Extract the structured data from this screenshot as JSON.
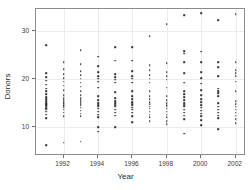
{
  "chart_data": {
    "type": "scatter",
    "title": "",
    "xlabel": "Year",
    "ylabel": "Donors",
    "xlim": [
      1990.4,
      2002.6
    ],
    "ylim": [
      4.0,
      34.5
    ],
    "xticks": [
      1992,
      1994,
      1996,
      1998,
      2000,
      2002
    ],
    "xticklabels": [
      "1992",
      "1994",
      "1996",
      "1998",
      "2000",
      "2002"
    ],
    "yticks": [
      10,
      20,
      30
    ],
    "yticklabels": [
      "10",
      "20",
      "30"
    ],
    "grid": true,
    "legend": null,
    "marker": "point",
    "marker_color": "#2e2e2e",
    "points": [
      {
        "x": 1991,
        "y": 27.0
      },
      {
        "x": 1991,
        "y": 21.2
      },
      {
        "x": 1991,
        "y": 20.4
      },
      {
        "x": 1991,
        "y": 19.6
      },
      {
        "x": 1991,
        "y": 18.8
      },
      {
        "x": 1991,
        "y": 18.0
      },
      {
        "x": 1991,
        "y": 17.4
      },
      {
        "x": 1991,
        "y": 16.8
      },
      {
        "x": 1991,
        "y": 16.2
      },
      {
        "x": 1991,
        "y": 15.8
      },
      {
        "x": 1991,
        "y": 15.4
      },
      {
        "x": 1991,
        "y": 15.0
      },
      {
        "x": 1991,
        "y": 14.8
      },
      {
        "x": 1991,
        "y": 14.5
      },
      {
        "x": 1991,
        "y": 14.2
      },
      {
        "x": 1991,
        "y": 13.9
      },
      {
        "x": 1991,
        "y": 13.6
      },
      {
        "x": 1991,
        "y": 13.2
      },
      {
        "x": 1991,
        "y": 12.6
      },
      {
        "x": 1991,
        "y": 11.8
      },
      {
        "x": 1991,
        "y": 6.2
      },
      {
        "x": 1992,
        "y": 23.4
      },
      {
        "x": 1992,
        "y": 22.0
      },
      {
        "x": 1992,
        "y": 21.0
      },
      {
        "x": 1992,
        "y": 20.2
      },
      {
        "x": 1992,
        "y": 19.4
      },
      {
        "x": 1992,
        "y": 18.6
      },
      {
        "x": 1992,
        "y": 17.6
      },
      {
        "x": 1992,
        "y": 16.6
      },
      {
        "x": 1992,
        "y": 16.0
      },
      {
        "x": 1992,
        "y": 15.6
      },
      {
        "x": 1992,
        "y": 15.2
      },
      {
        "x": 1992,
        "y": 14.9
      },
      {
        "x": 1992,
        "y": 14.6
      },
      {
        "x": 1992,
        "y": 14.3
      },
      {
        "x": 1992,
        "y": 14.0
      },
      {
        "x": 1992,
        "y": 13.6
      },
      {
        "x": 1992,
        "y": 13.0
      },
      {
        "x": 1992,
        "y": 12.2
      },
      {
        "x": 1992,
        "y": 6.8
      },
      {
        "x": 1993,
        "y": 26.0
      },
      {
        "x": 1993,
        "y": 23.0
      },
      {
        "x": 1993,
        "y": 21.6
      },
      {
        "x": 1993,
        "y": 20.8
      },
      {
        "x": 1993,
        "y": 20.0
      },
      {
        "x": 1993,
        "y": 19.2
      },
      {
        "x": 1993,
        "y": 18.4
      },
      {
        "x": 1993,
        "y": 17.4
      },
      {
        "x": 1993,
        "y": 16.6
      },
      {
        "x": 1993,
        "y": 16.0
      },
      {
        "x": 1993,
        "y": 15.6
      },
      {
        "x": 1993,
        "y": 15.2
      },
      {
        "x": 1993,
        "y": 14.8
      },
      {
        "x": 1993,
        "y": 14.4
      },
      {
        "x": 1993,
        "y": 14.0
      },
      {
        "x": 1993,
        "y": 13.4
      },
      {
        "x": 1993,
        "y": 12.8
      },
      {
        "x": 1993,
        "y": 12.2
      },
      {
        "x": 1993,
        "y": 7.0
      },
      {
        "x": 1994,
        "y": 24.6
      },
      {
        "x": 1994,
        "y": 22.6
      },
      {
        "x": 1994,
        "y": 21.4
      },
      {
        "x": 1994,
        "y": 20.6
      },
      {
        "x": 1994,
        "y": 20.0
      },
      {
        "x": 1994,
        "y": 19.4
      },
      {
        "x": 1994,
        "y": 18.2
      },
      {
        "x": 1994,
        "y": 16.4
      },
      {
        "x": 1994,
        "y": 15.6
      },
      {
        "x": 1994,
        "y": 15.0
      },
      {
        "x": 1994,
        "y": 14.6
      },
      {
        "x": 1994,
        "y": 14.2
      },
      {
        "x": 1994,
        "y": 13.8
      },
      {
        "x": 1994,
        "y": 13.2
      },
      {
        "x": 1994,
        "y": 12.6
      },
      {
        "x": 1994,
        "y": 12.0
      },
      {
        "x": 1994,
        "y": 10.0
      },
      {
        "x": 1994,
        "y": 9.0
      },
      {
        "x": 1995,
        "y": 26.6
      },
      {
        "x": 1995,
        "y": 23.8
      },
      {
        "x": 1995,
        "y": 21.0
      },
      {
        "x": 1995,
        "y": 20.4
      },
      {
        "x": 1995,
        "y": 19.8
      },
      {
        "x": 1995,
        "y": 19.2
      },
      {
        "x": 1995,
        "y": 17.2
      },
      {
        "x": 1995,
        "y": 16.0
      },
      {
        "x": 1995,
        "y": 15.4
      },
      {
        "x": 1995,
        "y": 15.0
      },
      {
        "x": 1995,
        "y": 14.6
      },
      {
        "x": 1995,
        "y": 14.2
      },
      {
        "x": 1995,
        "y": 13.6
      },
      {
        "x": 1995,
        "y": 13.0
      },
      {
        "x": 1995,
        "y": 12.4
      },
      {
        "x": 1995,
        "y": 10.0
      },
      {
        "x": 1996,
        "y": 26.6
      },
      {
        "x": 1996,
        "y": 23.8
      },
      {
        "x": 1996,
        "y": 21.6
      },
      {
        "x": 1996,
        "y": 20.6
      },
      {
        "x": 1996,
        "y": 20.0
      },
      {
        "x": 1996,
        "y": 19.2
      },
      {
        "x": 1996,
        "y": 17.4
      },
      {
        "x": 1996,
        "y": 16.4
      },
      {
        "x": 1996,
        "y": 15.8
      },
      {
        "x": 1996,
        "y": 15.2
      },
      {
        "x": 1996,
        "y": 14.8
      },
      {
        "x": 1996,
        "y": 14.4
      },
      {
        "x": 1996,
        "y": 14.0
      },
      {
        "x": 1996,
        "y": 13.6
      },
      {
        "x": 1996,
        "y": 13.0
      },
      {
        "x": 1996,
        "y": 12.2
      },
      {
        "x": 1996,
        "y": 11.0
      },
      {
        "x": 1997,
        "y": 28.8
      },
      {
        "x": 1997,
        "y": 22.8
      },
      {
        "x": 1997,
        "y": 21.8
      },
      {
        "x": 1997,
        "y": 20.8
      },
      {
        "x": 1997,
        "y": 20.0
      },
      {
        "x": 1997,
        "y": 19.2
      },
      {
        "x": 1997,
        "y": 17.4
      },
      {
        "x": 1997,
        "y": 16.4
      },
      {
        "x": 1997,
        "y": 15.8
      },
      {
        "x": 1997,
        "y": 15.2
      },
      {
        "x": 1997,
        "y": 14.8
      },
      {
        "x": 1997,
        "y": 14.2
      },
      {
        "x": 1997,
        "y": 13.8
      },
      {
        "x": 1997,
        "y": 13.2
      },
      {
        "x": 1997,
        "y": 12.6
      },
      {
        "x": 1997,
        "y": 12.0
      },
      {
        "x": 1997,
        "y": 11.2
      },
      {
        "x": 1998,
        "y": 31.4
      },
      {
        "x": 1998,
        "y": 23.2
      },
      {
        "x": 1998,
        "y": 21.4
      },
      {
        "x": 1998,
        "y": 20.6
      },
      {
        "x": 1998,
        "y": 19.8
      },
      {
        "x": 1998,
        "y": 18.2
      },
      {
        "x": 1998,
        "y": 16.4
      },
      {
        "x": 1998,
        "y": 15.6
      },
      {
        "x": 1998,
        "y": 15.0
      },
      {
        "x": 1998,
        "y": 14.6
      },
      {
        "x": 1998,
        "y": 14.2
      },
      {
        "x": 1998,
        "y": 13.8
      },
      {
        "x": 1998,
        "y": 13.2
      },
      {
        "x": 1998,
        "y": 12.6
      },
      {
        "x": 1998,
        "y": 12.0
      },
      {
        "x": 1998,
        "y": 11.2
      },
      {
        "x": 1998,
        "y": 10.6
      },
      {
        "x": 1999,
        "y": 33.2
      },
      {
        "x": 1999,
        "y": 25.8
      },
      {
        "x": 1999,
        "y": 25.2
      },
      {
        "x": 1999,
        "y": 23.4
      },
      {
        "x": 1999,
        "y": 21.2
      },
      {
        "x": 1999,
        "y": 19.2
      },
      {
        "x": 1999,
        "y": 17.4
      },
      {
        "x": 1999,
        "y": 16.8
      },
      {
        "x": 1999,
        "y": 16.2
      },
      {
        "x": 1999,
        "y": 15.6
      },
      {
        "x": 1999,
        "y": 15.0
      },
      {
        "x": 1999,
        "y": 14.6
      },
      {
        "x": 1999,
        "y": 14.2
      },
      {
        "x": 1999,
        "y": 13.6
      },
      {
        "x": 1999,
        "y": 13.0
      },
      {
        "x": 1999,
        "y": 12.4
      },
      {
        "x": 1999,
        "y": 11.6
      },
      {
        "x": 1999,
        "y": 8.6
      },
      {
        "x": 2000,
        "y": 33.6
      },
      {
        "x": 2000,
        "y": 25.6
      },
      {
        "x": 2000,
        "y": 23.4
      },
      {
        "x": 2000,
        "y": 21.4
      },
      {
        "x": 2000,
        "y": 20.2
      },
      {
        "x": 2000,
        "y": 19.0
      },
      {
        "x": 2000,
        "y": 17.6
      },
      {
        "x": 2000,
        "y": 16.6
      },
      {
        "x": 2000,
        "y": 15.8
      },
      {
        "x": 2000,
        "y": 15.2
      },
      {
        "x": 2000,
        "y": 14.6
      },
      {
        "x": 2000,
        "y": 14.0
      },
      {
        "x": 2000,
        "y": 13.4
      },
      {
        "x": 2000,
        "y": 12.8
      },
      {
        "x": 2000,
        "y": 12.2
      },
      {
        "x": 2000,
        "y": 11.4
      },
      {
        "x": 2000,
        "y": 10.4
      },
      {
        "x": 2001,
        "y": 32.2
      },
      {
        "x": 2001,
        "y": 23.4
      },
      {
        "x": 2001,
        "y": 22.4
      },
      {
        "x": 2001,
        "y": 20.6
      },
      {
        "x": 2001,
        "y": 18.0
      },
      {
        "x": 2001,
        "y": 17.4
      },
      {
        "x": 2001,
        "y": 17.0
      },
      {
        "x": 2001,
        "y": 16.4
      },
      {
        "x": 2001,
        "y": 15.0
      },
      {
        "x": 2001,
        "y": 14.2
      },
      {
        "x": 2001,
        "y": 13.6
      },
      {
        "x": 2001,
        "y": 13.0
      },
      {
        "x": 2001,
        "y": 12.4
      },
      {
        "x": 2001,
        "y": 11.8
      },
      {
        "x": 2001,
        "y": 9.6
      },
      {
        "x": 2002,
        "y": 33.4
      },
      {
        "x": 2002,
        "y": 23.4
      },
      {
        "x": 2002,
        "y": 21.8
      },
      {
        "x": 2002,
        "y": 21.2
      },
      {
        "x": 2002,
        "y": 20.6
      },
      {
        "x": 2002,
        "y": 19.4
      },
      {
        "x": 2002,
        "y": 17.4
      },
      {
        "x": 2002,
        "y": 15.4
      },
      {
        "x": 2002,
        "y": 14.8
      },
      {
        "x": 2002,
        "y": 14.2
      },
      {
        "x": 2002,
        "y": 13.6
      },
      {
        "x": 2002,
        "y": 13.0
      },
      {
        "x": 2002,
        "y": 12.4
      },
      {
        "x": 2002,
        "y": 11.6
      },
      {
        "x": 2002,
        "y": 10.8
      }
    ]
  }
}
